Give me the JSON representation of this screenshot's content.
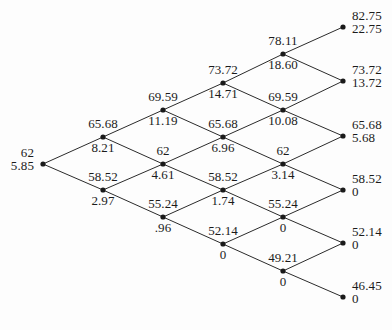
{
  "figure": {
    "type": "binomial-lattice",
    "steps": 5,
    "geometry": {
      "root_x": 43,
      "root_y": 164,
      "col_spacing": 60,
      "half_row_spacing": 27,
      "dot_radius": 2.6
    },
    "colors": {
      "background": "#fdfdfd",
      "edge": "#2b2b2b",
      "node": "#1a1a1a",
      "text": "#1b1b1b"
    }
  },
  "nodes": [
    {
      "id": "n0-0",
      "step": 0,
      "up": 0,
      "x": 43,
      "y": 164,
      "asset": "62",
      "option": "5.85",
      "placement": "right",
      "label_pos": "pair-left"
    },
    {
      "id": "n1-1",
      "step": 1,
      "up": 1,
      "x": 103,
      "y": 137,
      "asset": "65.68",
      "option": "8.21",
      "placement": "center",
      "label_pos": "split"
    },
    {
      "id": "n1-0",
      "step": 1,
      "up": 0,
      "x": 103,
      "y": 190,
      "asset": "58.52",
      "option": "2.97",
      "placement": "center",
      "label_pos": "split"
    },
    {
      "id": "n2-2",
      "step": 2,
      "up": 2,
      "x": 163,
      "y": 110,
      "asset": "69.59",
      "option": "11.19",
      "placement": "center",
      "label_pos": "split"
    },
    {
      "id": "n2-1",
      "step": 2,
      "up": 1,
      "x": 163,
      "y": 164,
      "asset": "62",
      "option": "4.61",
      "placement": "center",
      "label_pos": "split"
    },
    {
      "id": "n2-0",
      "step": 2,
      "up": 0,
      "x": 163,
      "y": 217,
      "asset": "55.24",
      "option": ".96",
      "placement": "center",
      "label_pos": "split"
    },
    {
      "id": "n3-3",
      "step": 3,
      "up": 3,
      "x": 223,
      "y": 83,
      "asset": "73.72",
      "option": "14.71",
      "placement": "center",
      "label_pos": "split"
    },
    {
      "id": "n3-2",
      "step": 3,
      "up": 2,
      "x": 223,
      "y": 137,
      "asset": "65.68",
      "option": "6.96",
      "placement": "center",
      "label_pos": "split"
    },
    {
      "id": "n3-1",
      "step": 3,
      "up": 1,
      "x": 223,
      "y": 190,
      "asset": "58.52",
      "option": "1.74",
      "placement": "center",
      "label_pos": "split"
    },
    {
      "id": "n3-0",
      "step": 3,
      "up": 0,
      "x": 223,
      "y": 244,
      "asset": "52.14",
      "option": "0",
      "placement": "center",
      "label_pos": "split"
    },
    {
      "id": "n4-4",
      "step": 4,
      "up": 4,
      "x": 283,
      "y": 54,
      "asset": "78.11",
      "option": "18.60",
      "placement": "center",
      "label_pos": "split"
    },
    {
      "id": "n4-3",
      "step": 4,
      "up": 3,
      "x": 283,
      "y": 110,
      "asset": "69.59",
      "option": "10.08",
      "placement": "center",
      "label_pos": "split"
    },
    {
      "id": "n4-2",
      "step": 4,
      "up": 2,
      "x": 283,
      "y": 164,
      "asset": "62",
      "option": "3.14",
      "placement": "center",
      "label_pos": "split"
    },
    {
      "id": "n4-1",
      "step": 4,
      "up": 1,
      "x": 283,
      "y": 217,
      "asset": "55.24",
      "option": "0",
      "placement": "center",
      "label_pos": "split"
    },
    {
      "id": "n4-0",
      "step": 4,
      "up": 0,
      "x": 283,
      "y": 271,
      "asset": "49.21",
      "option": "0",
      "placement": "center",
      "label_pos": "split"
    },
    {
      "id": "n5-5",
      "step": 5,
      "up": 5,
      "x": 343,
      "y": 27,
      "asset": "82.75",
      "option": "22.75",
      "placement": "left",
      "label_pos": "pair-right"
    },
    {
      "id": "n5-4",
      "step": 5,
      "up": 4,
      "x": 343,
      "y": 81,
      "asset": "73.72",
      "option": "13.72",
      "placement": "left",
      "label_pos": "pair-right"
    },
    {
      "id": "n5-3",
      "step": 5,
      "up": 3,
      "x": 343,
      "y": 136,
      "asset": "65.68",
      "option": "5.68",
      "placement": "left",
      "label_pos": "pair-right"
    },
    {
      "id": "n5-2",
      "step": 5,
      "up": 2,
      "x": 343,
      "y": 190,
      "asset": "58.52",
      "option": "0",
      "placement": "left",
      "label_pos": "pair-right"
    },
    {
      "id": "n5-1",
      "step": 5,
      "up": 1,
      "x": 343,
      "y": 243,
      "asset": "52.14",
      "option": "0",
      "placement": "left",
      "label_pos": "pair-right"
    },
    {
      "id": "n5-0",
      "step": 5,
      "up": 0,
      "x": 343,
      "y": 297,
      "asset": "46.45",
      "option": "0",
      "placement": "left",
      "label_pos": "pair-right"
    }
  ],
  "edges": [
    {
      "from": "n0-0",
      "to": "n1-1"
    },
    {
      "from": "n0-0",
      "to": "n1-0"
    },
    {
      "from": "n1-1",
      "to": "n2-2"
    },
    {
      "from": "n1-1",
      "to": "n2-1"
    },
    {
      "from": "n1-0",
      "to": "n2-1"
    },
    {
      "from": "n1-0",
      "to": "n2-0"
    },
    {
      "from": "n2-2",
      "to": "n3-3"
    },
    {
      "from": "n2-2",
      "to": "n3-2"
    },
    {
      "from": "n2-1",
      "to": "n3-2"
    },
    {
      "from": "n2-1",
      "to": "n3-1"
    },
    {
      "from": "n2-0",
      "to": "n3-1"
    },
    {
      "from": "n2-0",
      "to": "n3-0"
    },
    {
      "from": "n3-3",
      "to": "n4-4"
    },
    {
      "from": "n3-3",
      "to": "n4-3"
    },
    {
      "from": "n3-2",
      "to": "n4-3"
    },
    {
      "from": "n3-2",
      "to": "n4-2"
    },
    {
      "from": "n3-1",
      "to": "n4-2"
    },
    {
      "from": "n3-1",
      "to": "n4-1"
    },
    {
      "from": "n3-0",
      "to": "n4-1"
    },
    {
      "from": "n3-0",
      "to": "n4-0"
    },
    {
      "from": "n4-4",
      "to": "n5-5"
    },
    {
      "from": "n4-4",
      "to": "n5-4"
    },
    {
      "from": "n4-3",
      "to": "n5-4"
    },
    {
      "from": "n4-3",
      "to": "n5-3"
    },
    {
      "from": "n4-2",
      "to": "n5-3"
    },
    {
      "from": "n4-2",
      "to": "n5-2"
    },
    {
      "from": "n4-1",
      "to": "n5-2"
    },
    {
      "from": "n4-1",
      "to": "n5-1"
    },
    {
      "from": "n4-0",
      "to": "n5-1"
    },
    {
      "from": "n4-0",
      "to": "n5-0"
    }
  ]
}
